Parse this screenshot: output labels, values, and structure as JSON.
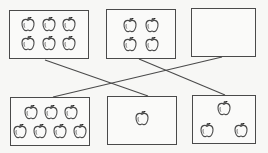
{
  "diagram": {
    "type": "matching-exercise",
    "colors": {
      "background": "#f7f7f5",
      "stroke": "#4a4a4a"
    },
    "top_row": [
      {
        "id": "top-1",
        "apple_count": 6,
        "rect": [
          9,
          10,
          80,
          49
        ],
        "apples": [
          [
            28,
            24
          ],
          [
            49,
            24
          ],
          [
            69,
            24
          ],
          [
            28,
            43
          ],
          [
            49,
            43
          ],
          [
            69,
            43
          ]
        ]
      },
      {
        "id": "top-2",
        "apple_count": 4,
        "rect": [
          106,
          9,
          70,
          50
        ],
        "apples": [
          [
            130,
            25
          ],
          [
            152,
            25
          ],
          [
            130,
            44
          ],
          [
            152,
            44
          ]
        ]
      },
      {
        "id": "top-3",
        "apple_count": 0,
        "rect": [
          191,
          8,
          65,
          49
        ],
        "apples": []
      }
    ],
    "bottom_row": [
      {
        "id": "bottom-1",
        "apple_count": 7,
        "rect": [
          10,
          97,
          80,
          49
        ],
        "apples": [
          [
            31,
            112
          ],
          [
            51,
            112
          ],
          [
            71,
            112
          ],
          [
            20,
            131
          ],
          [
            40,
            131
          ],
          [
            60,
            131
          ],
          [
            80,
            131
          ]
        ]
      },
      {
        "id": "bottom-2",
        "apple_count": 1,
        "rect": [
          107,
          96,
          70,
          49
        ],
        "apples": [
          [
            142,
            118
          ]
        ]
      },
      {
        "id": "bottom-3",
        "apple_count": 3,
        "rect": [
          192,
          95,
          64,
          49
        ],
        "apples": [
          [
            224,
            108
          ],
          [
            207,
            130
          ],
          [
            241,
            130
          ]
        ]
      }
    ],
    "connections": [
      {
        "from": "top-1",
        "to": "bottom-2",
        "line": [
          45,
          60,
          148,
          96
        ]
      },
      {
        "from": "top-2",
        "to": "bottom-3",
        "line": [
          139,
          59,
          225,
          95
        ]
      },
      {
        "from": "top-3",
        "to": "bottom-1",
        "line": [
          222,
          57,
          53,
          97
        ]
      }
    ]
  }
}
